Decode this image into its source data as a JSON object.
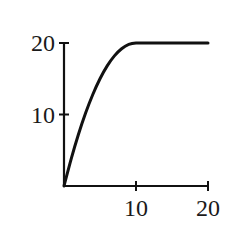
{
  "chart_data": {
    "type": "line",
    "title": "",
    "xlabel": "",
    "ylabel": "",
    "xlim": [
      0,
      20
    ],
    "ylim": [
      0,
      20
    ],
    "grid": false,
    "legend": null,
    "x_ticks": [
      10,
      20
    ],
    "x_tick_labels": [
      "10",
      "20"
    ],
    "y_ticks": [
      10,
      20
    ],
    "y_tick_labels": [
      "10",
      "20"
    ],
    "series": [
      {
        "name": "curve",
        "color": "#111111",
        "x": [
          0,
          1,
          2,
          3,
          4,
          5,
          6,
          7,
          8,
          9,
          10,
          12,
          14,
          16,
          18,
          20
        ],
        "y": [
          0,
          3.8,
          7.2,
          10.2,
          12.8,
          15,
          16.8,
          18.2,
          19.2,
          19.8,
          20,
          20,
          20,
          20,
          20,
          20
        ]
      }
    ]
  }
}
